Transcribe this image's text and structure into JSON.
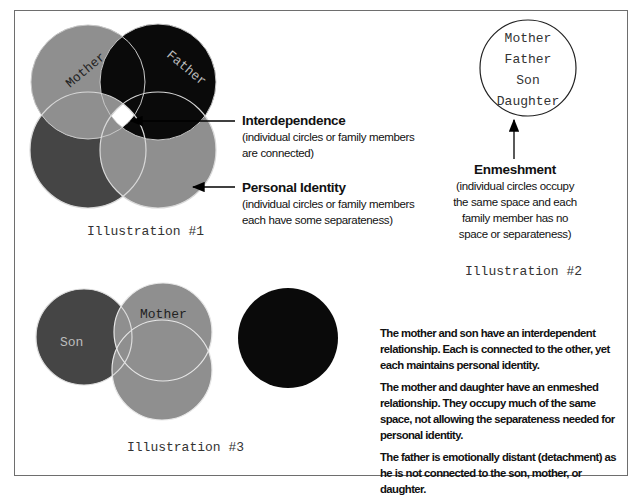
{
  "colors": {
    "light_gray": "#8f8f8f",
    "dark_gray": "#454545",
    "black": "#0a0a0a",
    "white": "#ffffff",
    "frame": "#6e6e6e"
  },
  "illustration1": {
    "caption": "Illustration #1",
    "circles": [
      {
        "name": "Mother",
        "label": "Mother",
        "fill": "#8f8f8f"
      },
      {
        "name": "Father",
        "label": "Father",
        "fill": "#0a0a0a"
      },
      {
        "name": "Daughter",
        "label": "",
        "fill": "#454545"
      },
      {
        "name": "Son",
        "label": "",
        "fill": "#8f8f8f"
      }
    ],
    "callouts": [
      {
        "title": "Interdependence",
        "lines": [
          "(individual circles or family members",
          "are connected)"
        ]
      },
      {
        "title": "Personal Identity",
        "lines": [
          "(individual circles or family members",
          "each have some separateness)"
        ]
      }
    ]
  },
  "illustration2": {
    "caption": "Illustration #2",
    "names": [
      "Mother",
      "Father",
      "Son",
      "Daughter"
    ],
    "callout": {
      "title": "Enmeshment",
      "lines": [
        "(individual circles occupy",
        "the same space and each",
        "family member has no",
        "space or separateness)"
      ]
    }
  },
  "illustration3": {
    "caption": "Illustration #3",
    "circles": [
      {
        "name": "Son",
        "label": "Son",
        "fill": "#454545"
      },
      {
        "name": "Mother",
        "label": "Mother",
        "fill": "#8f8f8f"
      },
      {
        "name": "Daughter",
        "label": "",
        "fill": "#8f8f8f"
      },
      {
        "name": "Father",
        "label": "",
        "fill": "#0a0a0a"
      }
    ],
    "paragraphs": [
      "The mother and son have an interdependent relationship.  Each is connected to the other, yet each maintains personal identity.",
      "The mother and daughter have an enmeshed relationship.  They occupy much of the same space, not allowing the separateness needed for personal identity.",
      "The father is emotionally distant (detachment) as he is not connected to the son, mother, or daughter."
    ]
  }
}
